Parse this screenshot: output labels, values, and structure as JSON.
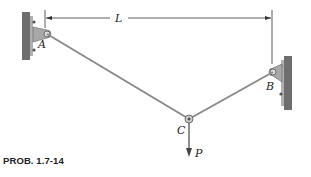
{
  "figure": {
    "caption": "PROB. 1.7-14",
    "labels": {
      "span": "L",
      "support_a": "A",
      "support_b": "B",
      "joint_c": "C",
      "load": "P"
    },
    "colors": {
      "wall": "#6e6e6e",
      "bracket": "#9a9a9a",
      "cable": "#8a8a8a",
      "line": "#333333"
    }
  }
}
